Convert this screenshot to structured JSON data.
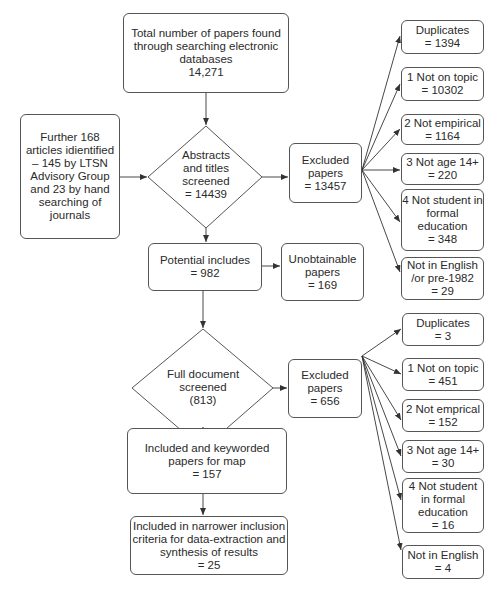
{
  "diagram": {
    "type": "flowchart",
    "nodes": {
      "total_found": {
        "lines": [
          "Total number of papers found",
          "through searching electronic",
          "databases",
          "14,271"
        ]
      },
      "further_articles": {
        "lines": [
          "Further 168",
          "articles idientified",
          "– 145 by LTSN",
          "Advisory Group",
          "and 23 by hand",
          "searching of",
          "journals"
        ]
      },
      "abstracts_screened": {
        "lines": [
          "Abstracts",
          "and titles",
          "screened",
          "= 14439"
        ]
      },
      "excluded_1": {
        "lines": [
          "Excluded",
          "papers",
          "= 13457"
        ]
      },
      "potential_includes": {
        "lines": [
          "Potential includes",
          "= 982"
        ]
      },
      "unobtainable": {
        "lines": [
          "Unobtainable",
          "papers",
          "= 169"
        ]
      },
      "full_doc_screened": {
        "lines": [
          "Full document",
          "screened",
          "(813)"
        ]
      },
      "excluded_2": {
        "lines": [
          "Excluded",
          "papers",
          "= 656"
        ]
      },
      "included_keyworded": {
        "lines": [
          "Included and keyworded",
          "papers for map",
          "= 157"
        ]
      },
      "narrower_inclusion": {
        "lines": [
          "Included in narrower inclusion",
          "criteria for data-extraction and",
          "synthesis of results",
          "= 25"
        ]
      }
    },
    "exclusions_1": [
      {
        "lines": [
          "Duplicates",
          "= 1394"
        ]
      },
      {
        "lines": [
          "1 Not on topic",
          "= 10302"
        ]
      },
      {
        "lines": [
          "2 Not empirical",
          "= 1164"
        ]
      },
      {
        "lines": [
          "3 Not age 14+",
          "= 220"
        ]
      },
      {
        "lines": [
          "4 Not student in",
          "formal",
          "education",
          "= 348"
        ]
      },
      {
        "lines": [
          "Not in English",
          "/or pre-1982",
          "= 29"
        ]
      }
    ],
    "exclusions_2": [
      {
        "lines": [
          "Duplicates",
          "= 3"
        ]
      },
      {
        "lines": [
          "1 Not on topic",
          "=  451"
        ]
      },
      {
        "lines": [
          "2 Not emprical",
          "= 152"
        ]
      },
      {
        "lines": [
          "3 Not age 14+",
          "= 30"
        ]
      },
      {
        "lines": [
          "4 Not student",
          "in formal",
          "education",
          "= 16"
        ]
      },
      {
        "lines": [
          "Not in English",
          "= 4"
        ]
      }
    ],
    "colors": {
      "stroke": "#555555",
      "text": "#2a2a2a",
      "background": "#ffffff"
    }
  }
}
